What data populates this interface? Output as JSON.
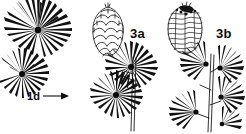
{
  "figure": {
    "kind": "botanical-line-art",
    "background_color": "#ffffff",
    "ink_color": "#0d0d0d",
    "width": 246,
    "height": 134,
    "labels": [
      {
        "id": "3a",
        "text": "3a",
        "target": "cone-outline-scales"
      },
      {
        "id": "3b",
        "text": "3b",
        "target": "cone-hatched"
      },
      {
        "id": "1d",
        "text": "1d",
        "target": "needle-rosette-lower-left",
        "arrow": "right"
      }
    ],
    "specimens": [
      {
        "id": "needle-rosette-upper-left",
        "type": "needle-fascicle",
        "description": "radiating whorl of long needles on a short spur shoot",
        "center_x": 38,
        "center_y": 30,
        "needle_count": 30,
        "radius": 32
      },
      {
        "id": "needle-rosette-lower-left",
        "type": "needle-fascicle",
        "description": "partial radiating whorl of needles, arrow target for 1d",
        "center_x": 22,
        "center_y": 74,
        "needle_count": 22,
        "radius": 26
      },
      {
        "id": "cone-outline-scales",
        "type": "seed-cone",
        "description": "ovoid cone drawn as outlined overlapping rounded scales",
        "center_x": 108,
        "center_y": 31,
        "width": 31,
        "height": 49,
        "shading": "outline"
      },
      {
        "id": "cone-hatched",
        "type": "seed-cone",
        "description": "ovoid cone with horizontal hatch lines and dark stippled apex",
        "center_x": 185,
        "center_y": 30,
        "width": 34,
        "height": 48,
        "shading": "hatched"
      },
      {
        "id": "branch-center",
        "type": "branchlet",
        "description": "upright stem bearing two radiating needle rosettes on short spurs",
        "stem_x": 131,
        "stem_top": 57,
        "stem_bottom": 131,
        "rosette_count": 2
      },
      {
        "id": "branch-right",
        "type": "branchlet",
        "description": "upright stem bearing four one-sided needle tufts on short spurs",
        "stem_x": 209,
        "stem_top": 54,
        "stem_bottom": 132,
        "rosette_count": 4
      }
    ],
    "arrow": {
      "id": "pointer-1d",
      "from_x": 43,
      "to_x": 68,
      "y": 96,
      "head": "solid-triangle"
    }
  }
}
